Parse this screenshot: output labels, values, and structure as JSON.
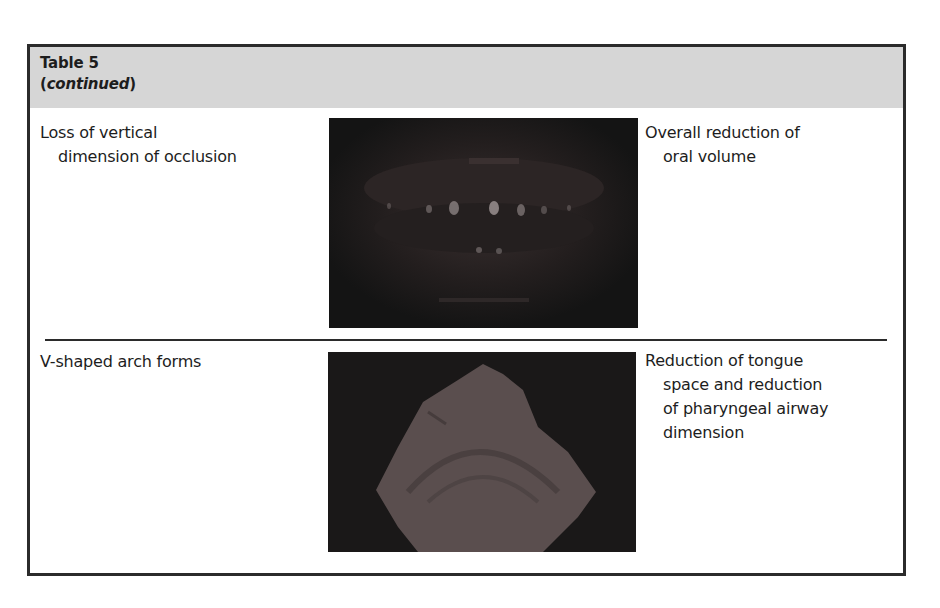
{
  "table": {
    "title": "Table 5",
    "subtitle_open": "(",
    "subtitle_italic": "continued",
    "subtitle_close": ")",
    "rows": [
      {
        "feature_line1": "Loss of vertical",
        "feature_line2": "dimension of occlusion",
        "image_alt": "Dark intraoral photograph showing collapsed bite / teeth in occlusion",
        "effect_line1": "Overall reduction of",
        "effect_line2": "oral volume"
      },
      {
        "feature_line1": "V-shaped arch forms",
        "image_alt": "Photograph of dental cast showing V-shaped arch on dark background",
        "effect_line1": "Reduction of tongue",
        "effect_line2": "space and reduction",
        "effect_line3": "of pharyngeal airway",
        "effect_line4": "dimension"
      }
    ]
  }
}
